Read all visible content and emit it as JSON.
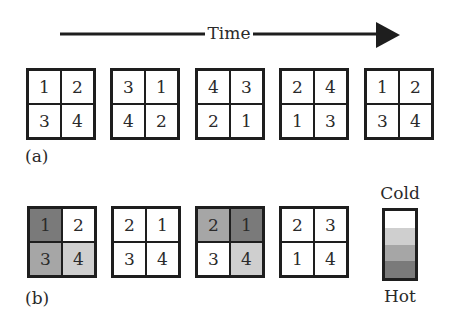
{
  "header": {
    "time_label": "Time"
  },
  "colors": {
    "cold": "#ffffff",
    "cool": "#cfcfcf",
    "warm": "#a6a6a6",
    "hot": "#7a7a7a",
    "border": "#1e1e1e"
  },
  "panel_a": {
    "label": "(a)",
    "grids": [
      {
        "cells": [
          {
            "v": "1",
            "c": "cold"
          },
          {
            "v": "2",
            "c": "cold"
          },
          {
            "v": "3",
            "c": "cold"
          },
          {
            "v": "4",
            "c": "cold"
          }
        ]
      },
      {
        "cells": [
          {
            "v": "3",
            "c": "cold"
          },
          {
            "v": "1",
            "c": "cold"
          },
          {
            "v": "4",
            "c": "cold"
          },
          {
            "v": "2",
            "c": "cold"
          }
        ]
      },
      {
        "cells": [
          {
            "v": "4",
            "c": "cold"
          },
          {
            "v": "3",
            "c": "cold"
          },
          {
            "v": "2",
            "c": "cold"
          },
          {
            "v": "1",
            "c": "cold"
          }
        ]
      },
      {
        "cells": [
          {
            "v": "2",
            "c": "cold"
          },
          {
            "v": "4",
            "c": "cold"
          },
          {
            "v": "1",
            "c": "cold"
          },
          {
            "v": "3",
            "c": "cold"
          }
        ]
      },
      {
        "cells": [
          {
            "v": "1",
            "c": "cold"
          },
          {
            "v": "2",
            "c": "cold"
          },
          {
            "v": "3",
            "c": "cold"
          },
          {
            "v": "4",
            "c": "cold"
          }
        ]
      }
    ]
  },
  "panel_b": {
    "label": "(b)",
    "grids": [
      {
        "cells": [
          {
            "v": "1",
            "c": "hot"
          },
          {
            "v": "2",
            "c": "cold"
          },
          {
            "v": "3",
            "c": "warm"
          },
          {
            "v": "4",
            "c": "cool"
          }
        ]
      },
      {
        "cells": [
          {
            "v": "2",
            "c": "cold"
          },
          {
            "v": "1",
            "c": "cold"
          },
          {
            "v": "3",
            "c": "cold"
          },
          {
            "v": "4",
            "c": "cold"
          }
        ]
      },
      {
        "cells": [
          {
            "v": "2",
            "c": "warm"
          },
          {
            "v": "1",
            "c": "hot"
          },
          {
            "v": "3",
            "c": "cold"
          },
          {
            "v": "4",
            "c": "cool"
          }
        ]
      },
      {
        "cells": [
          {
            "v": "2",
            "c": "cold"
          },
          {
            "v": "3",
            "c": "cold"
          },
          {
            "v": "1",
            "c": "cold"
          },
          {
            "v": "4",
            "c": "cold"
          }
        ]
      }
    ]
  },
  "legend": {
    "top_label": "Cold",
    "bottom_label": "Hot",
    "bands": [
      "cold",
      "cool",
      "warm",
      "hot"
    ]
  }
}
